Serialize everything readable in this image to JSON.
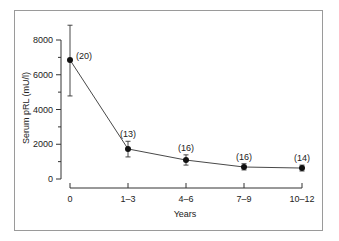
{
  "chart_data": {
    "type": "line",
    "title": "",
    "xlabel": "Years",
    "ylabel": "Serum pRL (mU/l)",
    "categories": [
      "0",
      "1–3",
      "4–6",
      "7–9",
      "10–12"
    ],
    "ylim": [
      0,
      8000
    ],
    "yticks": [
      0,
      2000,
      4000,
      6000,
      8000
    ],
    "ytick_labels": [
      "0",
      "2000",
      "4000",
      "6000",
      "8000"
    ],
    "yminor_ticks": [
      1000,
      3000,
      5000,
      7000
    ],
    "grid": false,
    "legend": "none",
    "series": [
      {
        "name": "Serum pRL",
        "values": [
          6850,
          1730,
          1090,
          690,
          630
        ],
        "error_upper": [
          8850,
          2170,
          1390,
          880,
          800
        ],
        "error_lower": [
          4780,
          1270,
          800,
          520,
          460
        ],
        "annotations": [
          "(20)",
          "(13)",
          "(16)",
          "(16)",
          "(14)"
        ]
      }
    ]
  }
}
